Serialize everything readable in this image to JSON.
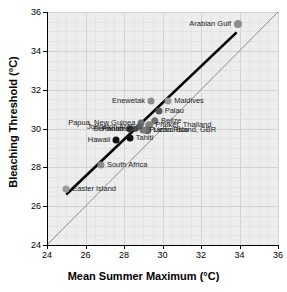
{
  "chart_data": {
    "type": "scatter",
    "title": "",
    "xlabel": "Mean Summer Maximum (°C)",
    "ylabel": "Bleaching Threshold (°C)",
    "xlim": [
      24,
      36
    ],
    "ylim": [
      24,
      36
    ],
    "xticks": [
      24,
      26,
      28,
      30,
      32,
      34,
      36
    ],
    "yticks": [
      24,
      26,
      28,
      30,
      32,
      34,
      36
    ],
    "grid": true,
    "legend": "none",
    "points": [
      {
        "label": "Arabian Gulf",
        "x": 33.9,
        "y": 35.4,
        "color": "#8c8c8c",
        "size": 8,
        "label_side": "left"
      },
      {
        "label": "Enewetak",
        "x": 29.4,
        "y": 31.4,
        "color": "#8c8c8c",
        "size": 7,
        "label_side": "left"
      },
      {
        "label": "Maldives",
        "x": 30.3,
        "y": 31.4,
        "color": "#9a9a9a",
        "size": 7,
        "label_side": "right"
      },
      {
        "label": "Palau",
        "x": 29.8,
        "y": 30.9,
        "color": "#5a5a5a",
        "size": 7,
        "label_side": "right"
      },
      {
        "label": "Belize",
        "x": 29.6,
        "y": 30.4,
        "color": "#6e6e6e",
        "size": 7.5,
        "label_side": "right"
      },
      {
        "label": "Phuket, Thailand",
        "x": 29.3,
        "y": 30.2,
        "color": "#828282",
        "size": 7.5,
        "label_side": "right"
      },
      {
        "label": "Lizard Island, GBR",
        "x": 29.2,
        "y": 29.9,
        "color": "#6a6a6a",
        "size": 7.5,
        "label_side": "right"
      },
      {
        "label": "Puerto Rico",
        "x": 29.0,
        "y": 29.9,
        "color": "#7a7a7a",
        "size": 7,
        "label_side": "right"
      },
      {
        "label": "Papua, New Guinea",
        "x": 28.9,
        "y": 30.3,
        "color": "#6e6e6e",
        "size": 7,
        "label_side": "left"
      },
      {
        "label": "Johnston Atoll",
        "x": 28.8,
        "y": 30.1,
        "color": "#5c5c5c",
        "size": 6.5,
        "label_side": "left"
      },
      {
        "label": "Panama",
        "x": 28.6,
        "y": 30.0,
        "color": "#4a4a4a",
        "size": 6.5,
        "label_side": "left"
      },
      {
        "label": "Bermuda",
        "x": 28.3,
        "y": 30.0,
        "color": "#3a3a3a",
        "size": 7,
        "label_side": "left"
      },
      {
        "label": "Tahiti",
        "x": 28.3,
        "y": 29.5,
        "color": "#111111",
        "size": 7,
        "label_side": "right"
      },
      {
        "label": "Hawaii",
        "x": 27.6,
        "y": 29.4,
        "color": "#111111",
        "size": 7,
        "label_side": "left"
      },
      {
        "label": "South Africa",
        "x": 26.8,
        "y": 28.1,
        "color": "#8c8c8c",
        "size": 7,
        "label_side": "right"
      },
      {
        "label": "Easter Island",
        "x": 25.0,
        "y": 26.9,
        "color": "#9a9a9a",
        "size": 7,
        "label_side": "right"
      }
    ],
    "lines": [
      {
        "name": "one-to-one-line",
        "x1": 24.0,
        "y1": 24.0,
        "x2": 36.0,
        "y2": 36.0,
        "color": "#8a8a8a",
        "width": 1.0,
        "style": "solid"
      },
      {
        "name": "regression-line",
        "x1": 25.0,
        "y1": 26.6,
        "x2": 33.85,
        "y2": 34.95,
        "color": "#000000",
        "width": 2.6,
        "style": "solid"
      }
    ],
    "colors": {
      "plot_background": "#ededed",
      "grid_major": "#d2d2d2",
      "grid_minor": "#e3e3e3",
      "axis": "#000000",
      "figure_background": "#ffffff"
    }
  }
}
